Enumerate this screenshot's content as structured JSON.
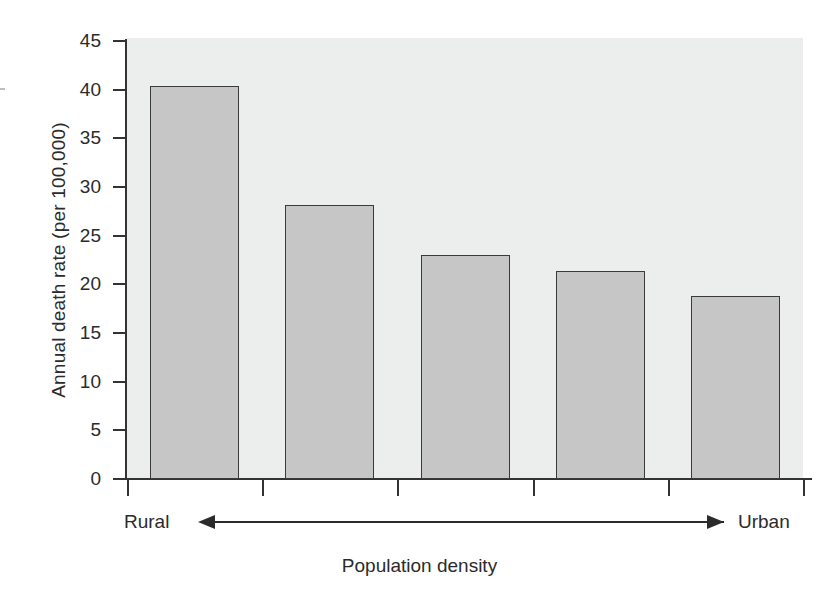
{
  "chart_data": {
    "type": "bar",
    "title": "",
    "xlabel": "Population density",
    "ylabel": "Annual death rate (per 100,000)",
    "categories": [
      "1",
      "2",
      "3",
      "4",
      "5"
    ],
    "values": [
      40.4,
      28.2,
      23.0,
      21.4,
      18.8
    ],
    "ylim": [
      0,
      45
    ],
    "yticks": [
      0,
      5,
      10,
      15,
      20,
      25,
      30,
      35,
      40,
      45
    ],
    "ytick_labels": [
      "0",
      "5",
      "10",
      "15",
      "20",
      "25",
      "30",
      "35",
      "40",
      "45"
    ],
    "xtick_labels": [
      "",
      "",
      "",
      "",
      "",
      ""
    ],
    "grid": false,
    "legend": null,
    "annotations": {
      "axis_left_end": "Rural",
      "axis_right_end": "Urban",
      "direction_arrow": "double-headed arrow from Rural to Urban"
    },
    "series": [
      {
        "name": "Annual death rate",
        "values": [
          40.4,
          28.2,
          23.0,
          21.4,
          18.8
        ]
      }
    ],
    "colors": {
      "bar_fill": "#c6c6c6",
      "bar_edge": "#3a3a3a",
      "plot_background": "#eceded",
      "axis": "#333333",
      "text": "#2b2b2b",
      "figure_background": "#ffffff"
    }
  }
}
